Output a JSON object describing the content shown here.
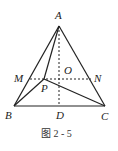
{
  "figure": {
    "caption": "图 2 - 5",
    "points": {
      "A": {
        "label": "A",
        "x": 59,
        "y": 26
      },
      "B": {
        "label": "B",
        "x": 14,
        "y": 106
      },
      "C": {
        "label": "C",
        "x": 105,
        "y": 106
      },
      "D": {
        "label": "D",
        "x": 59,
        "y": 106
      },
      "M": {
        "label": "M",
        "x": 30,
        "y": 79
      },
      "N": {
        "label": "N",
        "x": 91,
        "y": 79
      },
      "O": {
        "label": "O",
        "x": 59,
        "y": 79
      },
      "P": {
        "label": "P",
        "x": 44,
        "y": 79
      }
    },
    "solid_segments": [
      "AB",
      "AC",
      "BC",
      "AP",
      "BP",
      "CP"
    ],
    "dashed_segments": [
      "AD",
      "MN"
    ],
    "colors": {
      "line": "#222222",
      "background": "#ffffff"
    }
  }
}
